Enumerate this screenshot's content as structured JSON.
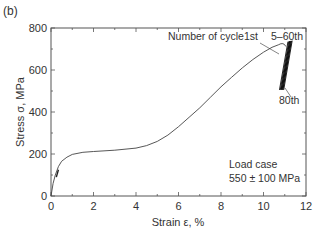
{
  "panel_label": "(b)",
  "chart_data": {
    "type": "line",
    "title": "",
    "xlabel": "Strain ε, %",
    "ylabel": "Stress σ, MPa",
    "xlim": [
      0,
      12
    ],
    "ylim": [
      0,
      800
    ],
    "xticks": [
      0,
      2,
      4,
      6,
      8,
      10,
      12
    ],
    "yticks": [
      0,
      200,
      400,
      600,
      800
    ],
    "grid": false,
    "series": [
      {
        "name": "1st cycle loading",
        "x": [
          0,
          0.1,
          0.2,
          0.35,
          0.5,
          0.75,
          1.0,
          1.5,
          2.0,
          3.0,
          4.0,
          4.5,
          5.0,
          5.5,
          6.0,
          6.5,
          7.0,
          7.5,
          8.0,
          8.5,
          9.0,
          9.5,
          10.0,
          10.4,
          10.7
        ],
        "y": [
          0,
          60,
          100,
          140,
          165,
          185,
          198,
          208,
          212,
          218,
          228,
          240,
          260,
          290,
          330,
          375,
          420,
          470,
          520,
          565,
          610,
          650,
          685,
          708,
          720
        ]
      },
      {
        "name": "5–60th cycles",
        "x": [
          10.75,
          11.15
        ],
        "y": [
          505,
          735
        ]
      },
      {
        "name": "80th cycle",
        "x": [
          10.95,
          11.35
        ],
        "y": [
          505,
          740
        ]
      }
    ],
    "annotations": [
      {
        "text": "Number of cycle",
        "x": 6.2,
        "y": 740
      },
      {
        "text": "1st",
        "x": 9.9,
        "y": 740
      },
      {
        "text": "5–60th",
        "x": 10.6,
        "y": 745
      },
      {
        "text": "80th",
        "x": 10.7,
        "y": 445
      },
      {
        "text": "Load case",
        "x": 9.0,
        "y": 160
      },
      {
        "text": "550 ± 100 MPa",
        "x": 9.0,
        "y": 95
      }
    ]
  },
  "labels": {
    "number_of_cycle": "Number of cycle",
    "first": "1st",
    "mid": "5–60th",
    "last": "80th",
    "load_case": "Load case",
    "load_value": "550 ± 100 MPa",
    "xlabel": "Strain ε, %",
    "ylabel": "Stress σ, MPa"
  }
}
